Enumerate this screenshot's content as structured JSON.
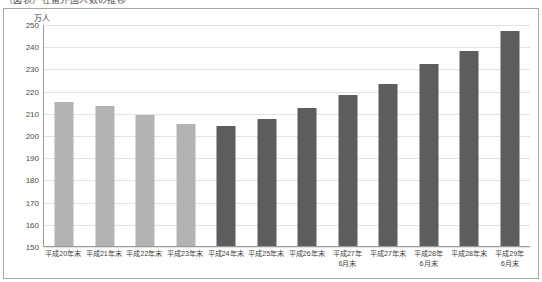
{
  "top_strip": {
    "clipped_text": "（図表）在留外国人数の推移"
  },
  "axis": {
    "unit_label": "万人"
  },
  "chart_data": {
    "type": "bar",
    "title": "",
    "xlabel": "",
    "ylabel": "万人",
    "ylim": [
      150,
      250
    ],
    "ytick_step": 10,
    "yticks": [
      150,
      160,
      170,
      180,
      190,
      200,
      210,
      220,
      230,
      240,
      250
    ],
    "grid": true,
    "legend": "none",
    "categories": [
      "平成20年末",
      "平成21年末",
      "平成22年末",
      "平成23年末",
      "平成24年末",
      "平成25年末",
      "平成26年末",
      "平成27年\n6月末",
      "平成27年末",
      "平成28年\n6月末",
      "平成28年末",
      "平成29年\n6月末"
    ],
    "category_lines": [
      [
        "平成20年末",
        ""
      ],
      [
        "平成21年末",
        ""
      ],
      [
        "平成22年末",
        ""
      ],
      [
        "平成23年末",
        ""
      ],
      [
        "平成24年末",
        ""
      ],
      [
        "平成25年末",
        ""
      ],
      [
        "平成26年末",
        ""
      ],
      [
        "平成27年",
        "6月末"
      ],
      [
        "平成27年末",
        ""
      ],
      [
        "平成28年",
        "6月末"
      ],
      [
        "平成28年末",
        ""
      ],
      [
        "平成29年",
        "6月末"
      ]
    ],
    "values": [
      215,
      213,
      209,
      205,
      204,
      207,
      212,
      218,
      223,
      232,
      238,
      247
    ],
    "bar_colors": [
      "#b3b3b3",
      "#b3b3b3",
      "#b3b3b3",
      "#b3b3b3",
      "#5d5d5d",
      "#5d5d5d",
      "#5d5d5d",
      "#5d5d5d",
      "#5d5d5d",
      "#5d5d5d",
      "#5d5d5d",
      "#5d5d5d"
    ],
    "color_light": "#b3b3b3",
    "color_dark": "#5d5d5d",
    "gridline_color": "#e3e3e3",
    "axis_color": "#9b9b9b",
    "frame_color": "#a9a9a9"
  }
}
